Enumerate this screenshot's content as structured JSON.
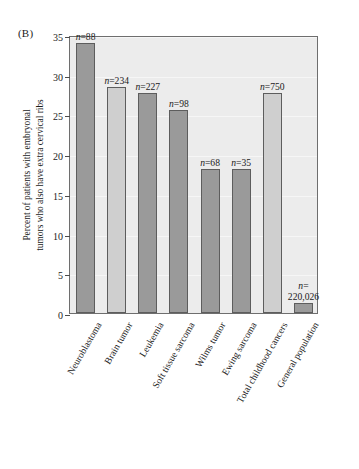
{
  "panel": {
    "label": "(B)"
  },
  "axes": {
    "ylabel_line1": "Percent of patients with embryonal",
    "ylabel_line2": "tumors who also have extra cervical ribs",
    "yticks": [
      "0",
      "5",
      "10",
      "15",
      "20",
      "25",
      "30",
      "35"
    ],
    "xlabel": ""
  },
  "colors": {
    "plot_background": "#ececec",
    "bar_dark": "#9a9a9a",
    "bar_light": "#cfcfcf",
    "axis": "#6e6e6e",
    "text": "#1b1b1b"
  },
  "chart_data": {
    "type": "bar",
    "title": "(B)",
    "xlabel": "",
    "ylabel": "Percent of patients with embryonal tumors who also have extra cervical ribs",
    "ylim": [
      0,
      35
    ],
    "ytick_step": 5,
    "grid": false,
    "legend": "none",
    "categories": [
      "Neuroblastoma",
      "Brain tumor",
      "Leukemia",
      "Soft tissue sarcoma",
      "Wilms tumor",
      "Ewing sarcoma",
      "Total childhood cancers",
      "General population"
    ],
    "values": [
      34.0,
      28.5,
      27.7,
      25.5,
      18.1,
      18.1,
      27.7,
      1.2
    ],
    "annotations": [
      "n=88",
      "n=234",
      "n=227",
      "n=98",
      "n=68",
      "n=35",
      "n=750",
      "n= 220,026"
    ],
    "sample_sizes": [
      88,
      234,
      227,
      98,
      68,
      35,
      750,
      220026
    ],
    "bar_shades": [
      "dark",
      "light",
      "dark",
      "dark",
      "dark",
      "dark",
      "light",
      "dark"
    ]
  }
}
